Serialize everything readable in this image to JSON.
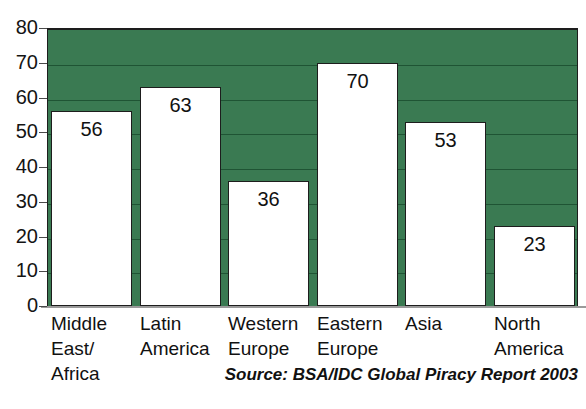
{
  "chart_data": {
    "type": "bar",
    "title": "",
    "xlabel": "",
    "ylabel": "",
    "ylim": [
      0,
      80
    ],
    "ytick_step": 10,
    "yticks": [
      0,
      10,
      20,
      30,
      40,
      50,
      60,
      70,
      80
    ],
    "grid": true,
    "legend": "none",
    "categories": [
      "Middle\nEast/\nAfrica",
      "Latin\nAmerica",
      "Western\nEurope",
      "Eastern\nEurope",
      "Asia",
      "North\nAmerica"
    ],
    "values": [
      56,
      63,
      36,
      70,
      53,
      23
    ],
    "value_labels": [
      "56",
      "63",
      "36",
      "70",
      "53",
      "23"
    ],
    "source_note": "Source: BSA/IDC Global Piracy Report 2003",
    "colors": {
      "plot_background": "#3a7a52",
      "gridline": "#1f5434",
      "bar_fill": "#ffffff",
      "bar_outline": "#1d1d1d",
      "text": "#111111",
      "axis": "#9a9a9a"
    }
  }
}
